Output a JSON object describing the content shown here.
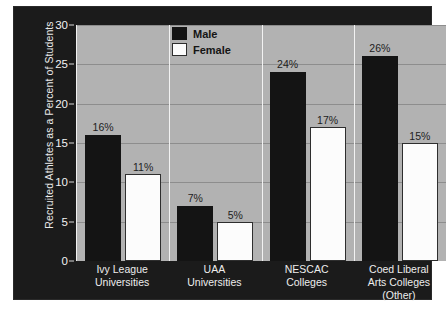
{
  "chart_data": {
    "type": "bar",
    "title": "",
    "xlabel": "",
    "ylabel": "Recruited Athletes as a Percent of Students",
    "ylim": [
      0,
      30
    ],
    "ytick_labels": [
      "0",
      "5",
      "10",
      "15",
      "20",
      "25",
      "30"
    ],
    "ytick_values": [
      0,
      5,
      10,
      15,
      20,
      25,
      30
    ],
    "grid": true,
    "legend_position": "top-center",
    "categories": [
      "Ivy League Universities",
      "UAA Universities",
      "NESCAC Colleges",
      "Coed Liberal Arts Colleges (Other)"
    ],
    "category_lines": [
      [
        "Ivy League",
        "Universities"
      ],
      [
        "UAA",
        "Universities"
      ],
      [
        "NESCAC",
        "Colleges"
      ],
      [
        "Coed Liberal",
        "Arts Colleges",
        "(Other)"
      ]
    ],
    "series": [
      {
        "name": "Male",
        "color": "#141414",
        "values": [
          16,
          7,
          24,
          26
        ],
        "labels": [
          "16%",
          "7%",
          "24%",
          "26%"
        ]
      },
      {
        "name": "Female",
        "color": "#fcfcfc",
        "values": [
          11,
          5,
          17,
          15
        ],
        "labels": [
          "11%",
          "5%",
          "17%",
          "15%"
        ]
      }
    ]
  },
  "legend": {
    "items": [
      {
        "label": "Male",
        "swatch": "male"
      },
      {
        "label": "Female",
        "swatch": "female"
      }
    ]
  },
  "colors": {
    "figure_background": "#1b1b1b",
    "plot_background": "#b2b2b2",
    "gridline": "#8d8d8d",
    "male_bar": "#141414",
    "female_bar": "#fcfcfc",
    "axis_text": "#f2f2f2"
  },
  "caption": {
    "text": ""
  }
}
